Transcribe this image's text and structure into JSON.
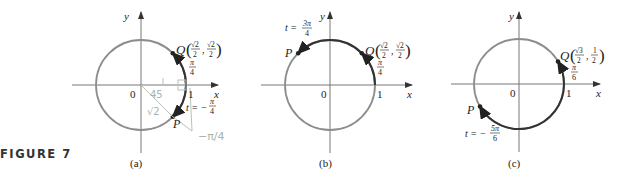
{
  "figure": {
    "label": "FIGURE 7",
    "colors": {
      "circle": "#8d8d8d",
      "arc": "#333333",
      "axis": "#777777",
      "pencil": "#b9c2b9"
    },
    "panels": [
      {
        "id": "a",
        "caption": "(a)",
        "axis_x_label": "x",
        "axis_y_label": "y",
        "origin_label": "0",
        "one_label": "1",
        "point_Q_label": "Q",
        "point_Q_coords": "(√2/2, √2/2)",
        "point_Q_x": "√2",
        "point_Q_y": "√2",
        "denominator": "2",
        "arc_label_num": "π",
        "arc_label_den": "4",
        "point_P_label": "P",
        "t_label": "t = −",
        "t_num": "π",
        "t_den": "4",
        "annotations": [
          "45",
          "√2",
          "1",
          "−π/4"
        ]
      },
      {
        "id": "b",
        "caption": "(b)",
        "axis_x_label": "x",
        "axis_y_label": "y",
        "origin_label": "0",
        "one_label": "1",
        "point_Q_label": "Q",
        "point_Q_coords": "(√2/2, √2/2)",
        "point_Q_x": "√2",
        "point_Q_y": "√2",
        "denominator": "2",
        "arc_label_num": "π",
        "arc_label_den": "4",
        "point_P_label": "P",
        "t_label": "t =",
        "t_num": "3π",
        "t_den": "4"
      },
      {
        "id": "c",
        "caption": "(c)",
        "axis_x_label": "x",
        "axis_y_label": "y",
        "origin_label": "0",
        "one_label": "1",
        "point_Q_label": "Q",
        "point_Q_coords": "(√3/2, 1/2)",
        "point_Q_x": "√3",
        "point_Q_y": "1",
        "denominator": "2",
        "arc_label_num": "π",
        "arc_label_den": "6",
        "point_P_label": "P",
        "t_label": "t = −",
        "t_num": "5π",
        "t_den": "6"
      }
    ]
  }
}
